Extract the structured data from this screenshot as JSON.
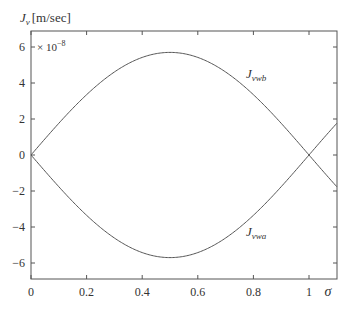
{
  "chart_data": {
    "type": "line",
    "title": "",
    "ylabel_symbol": "J",
    "ylabel_sub": "v",
    "ylabel_unit": "[m/sec]",
    "xlabel": "σ",
    "y_multiplier": "× 10",
    "y_multiplier_exp": "−8",
    "xlim": [
      0,
      1.1
    ],
    "ylim": [
      -7,
      7
    ],
    "xticks": [
      0,
      0.2,
      0.4,
      0.6,
      0.8,
      1
    ],
    "xtick_labels": [
      "0",
      "0.2",
      "0.4",
      "0.6",
      "0.8",
      "1"
    ],
    "yticks": [
      6,
      4,
      2,
      0,
      -2,
      -4,
      -6
    ],
    "ytick_labels": [
      "6",
      "4",
      "2",
      "0",
      "−2",
      "−4",
      "−6"
    ],
    "grid": false,
    "x": [
      0,
      0.1,
      0.2,
      0.3,
      0.4,
      0.5,
      0.6,
      0.7,
      0.8,
      0.9,
      1.0,
      1.1
    ],
    "series": [
      {
        "name": "J_vwb",
        "label_main": "J",
        "label_sub": "vwb",
        "values": [
          0,
          1.76,
          3.35,
          4.61,
          5.42,
          5.7,
          5.42,
          4.61,
          3.35,
          1.76,
          0,
          -2.1
        ]
      },
      {
        "name": "J_vwa",
        "label_main": "J",
        "label_sub": "vwa",
        "values": [
          0,
          -1.76,
          -3.35,
          -4.61,
          -5.42,
          -5.7,
          -5.42,
          -4.61,
          -3.35,
          -1.76,
          0,
          2.1
        ]
      }
    ],
    "annotations": [
      {
        "text": "J_vwb",
        "x": 0.8,
        "y": 4.6
      },
      {
        "text": "J_vwa",
        "x": 0.8,
        "y": -5.4
      }
    ]
  }
}
